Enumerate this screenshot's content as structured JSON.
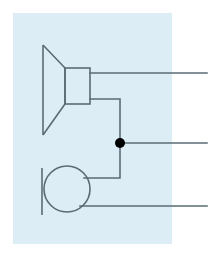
{
  "canvas": {
    "width": 213,
    "height": 261,
    "background_color": "#ffffff"
  },
  "panel": {
    "label": "diagram-background-panel",
    "fill_color": "#dcedf5",
    "x": 13,
    "y": 13,
    "width": 159,
    "height": 231
  },
  "style": {
    "stroke_color": "#5a6b75",
    "stroke_width": 1.6,
    "node_fill_color": "#000000"
  },
  "shapes": {
    "horn": {
      "label": "loudspeaker-horn-symbol",
      "points": "43,45 65,68 65,104 43,135",
      "description": "trapezoid horn flare"
    },
    "horn_back_bar": {
      "label": "horn-back-vertical-bar",
      "x1": 43,
      "y1": 45,
      "x2": 43,
      "y2": 135
    },
    "horn_body": {
      "label": "loudspeaker-body-rectangle",
      "x": 65,
      "y": 68,
      "width": 25,
      "height": 36
    },
    "circle": {
      "label": "circular-element",
      "cx": 67,
      "cy": 189,
      "r": 23
    },
    "circle_bar": {
      "label": "circle-left-vertical-bar",
      "x1": 42,
      "y1": 168,
      "x2": 42,
      "y2": 215
    },
    "junction_node": {
      "label": "junction-node-dot",
      "cx": 120,
      "cy": 143,
      "r": 5
    }
  },
  "wires": [
    {
      "label": "output-wire-top",
      "path": "M 90,73 L 207,73",
      "terminal_y": 73
    },
    {
      "label": "horn-to-junction-wire",
      "path": "M 90,99 L 120,99 L 120,143"
    },
    {
      "label": "output-wire-middle",
      "path": "M 120,143 L 207,143",
      "terminal_y": 143
    },
    {
      "label": "junction-to-circle-wire",
      "path": "M 120,143 L 120,178 L 84,178"
    },
    {
      "label": "output-wire-bottom",
      "path": "M 80,206 L 207,206",
      "terminal_y": 206
    }
  ]
}
